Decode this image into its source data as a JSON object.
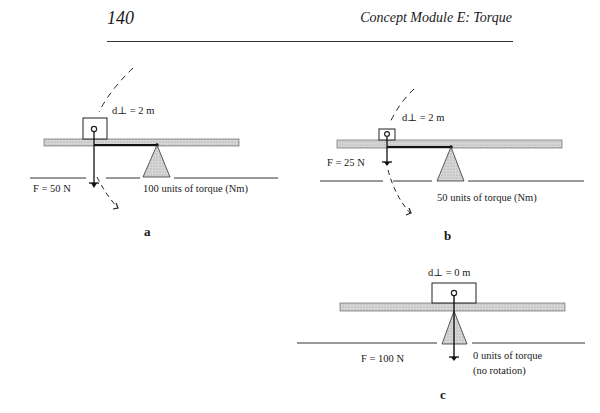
{
  "header": {
    "page_number": "140",
    "running_title": "Concept Module E:   Torque"
  },
  "figures": {
    "a": {
      "label": "a",
      "distance": "d⊥ = 2 m",
      "force": "F = 50 N",
      "torque": "100 units of torque (Nm)"
    },
    "b": {
      "label": "b",
      "distance": "d⊥ = 2 m",
      "force": "F = 25 N",
      "torque": "50 units of torque (Nm)"
    },
    "c": {
      "label": "c",
      "distance": "d⊥ = 0 m",
      "force": "F = 100 N",
      "torque_line1": "0 units of torque",
      "torque_line2": "(no rotation)"
    }
  },
  "colors": {
    "beam": "#c8c8c8",
    "fulcrum": "#b8b8b8",
    "ink": "#1a1a1a"
  }
}
